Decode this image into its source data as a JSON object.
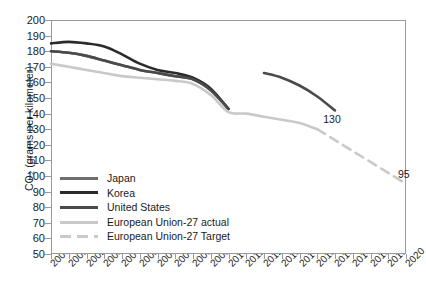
{
  "chart_data": {
    "type": "line",
    "title": "",
    "xlabel": "",
    "ylabel": "CO2 (grams per kilometer)",
    "ylabel_prefix": "CO",
    "ylabel_sub": "2",
    "ylabel_suffix": " (grams per kilometer)",
    "xlim": [
      2000,
      2020
    ],
    "ylim": [
      50,
      200
    ],
    "ytick_step": 10,
    "grid": false,
    "legend_position": "lower-left-inside",
    "yticks": [
      200,
      190,
      180,
      170,
      160,
      150,
      140,
      130,
      120,
      110,
      100,
      90,
      80,
      70,
      60,
      50
    ],
    "xticks": [
      "2000",
      "2001",
      "2002",
      "2003",
      "2004",
      "2005",
      "2006",
      "2007",
      "2008",
      "2009",
      "2010",
      "2011",
      "2012",
      "2013",
      "2014",
      "2015",
      "2016",
      "2017",
      "2018",
      "2019",
      "2020"
    ],
    "series": [
      {
        "name": "Japan",
        "color": "#6e6e6e",
        "style": "solid",
        "x": [
          2000,
          2001,
          2002,
          2003,
          2004,
          2005,
          2006,
          2007,
          2008,
          2009,
          2010
        ],
        "values": [
          180,
          179,
          177,
          174,
          171,
          168,
          166,
          164,
          162,
          155,
          143
        ]
      },
      {
        "name": "Korea",
        "color": "#2b2b2b",
        "style": "solid",
        "x": [
          2000,
          2001,
          2002,
          2003,
          2004,
          2005,
          2006,
          2007,
          2008,
          2009,
          2010
        ],
        "values": [
          185,
          186,
          185,
          183,
          178,
          172,
          168,
          166,
          163,
          156,
          143
        ]
      },
      {
        "name": "Korea projected",
        "color": "#4a4a4a",
        "style": "solid",
        "x": [
          2012,
          2013,
          2014,
          2015,
          2016
        ],
        "values": [
          166,
          163,
          158,
          151,
          142
        ]
      },
      {
        "name": "United States",
        "color": "#4a4a4a",
        "style": "solid",
        "x": [
          2000,
          2001,
          2002,
          2003,
          2004,
          2005,
          2006,
          2007,
          2008,
          2009,
          2010
        ],
        "values": [
          180,
          179,
          177,
          174,
          171,
          168,
          166,
          164,
          162,
          155,
          143
        ]
      },
      {
        "name": "European Union-27 actual",
        "color": "#c9c9c9",
        "style": "solid",
        "x": [
          2000,
          2001,
          2002,
          2003,
          2004,
          2005,
          2006,
          2007,
          2008,
          2009,
          2010,
          2011,
          2012,
          2013,
          2014,
          2015
        ],
        "values": [
          172,
          170,
          168,
          166,
          164,
          163,
          162,
          161,
          159,
          152,
          141,
          140,
          138,
          136,
          134,
          130
        ]
      },
      {
        "name": "European Union-27 Target",
        "color": "#c9c9c9",
        "style": "dashed",
        "x": [
          2015,
          2016,
          2017,
          2018,
          2019,
          2020
        ],
        "values": [
          130,
          123,
          116,
          109,
          102,
          95
        ]
      }
    ],
    "annotations": [
      {
        "text": "130",
        "x": 2015,
        "y": 130
      },
      {
        "text": "95",
        "x": 2020,
        "y": 95
      }
    ]
  },
  "legend": {
    "items": [
      {
        "label": "Japan",
        "color": "#6e6e6e",
        "style": "solid"
      },
      {
        "label": "Korea",
        "color": "#2b2b2b",
        "style": "solid"
      },
      {
        "label": "United States",
        "color": "#4a4a4a",
        "style": "solid"
      },
      {
        "label": "European Union-27 actual",
        "color": "#c9c9c9",
        "style": "solid"
      },
      {
        "label": "European Union-27 Target",
        "color": "#c9c9c9",
        "style": "dashed"
      }
    ]
  }
}
